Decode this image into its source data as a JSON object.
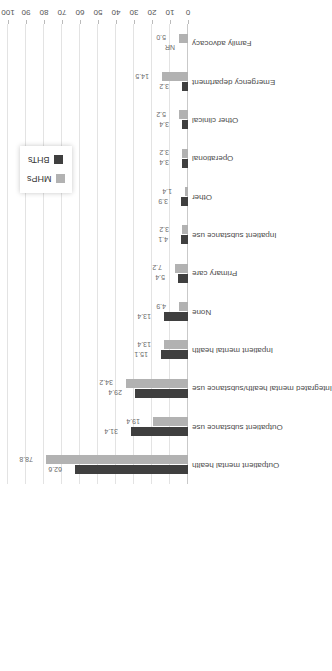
{
  "chart_data": {
    "type": "bar",
    "title": "",
    "subtitle": "",
    "xlabel": "",
    "ylabel": "",
    "ylim": [
      0,
      100
    ],
    "yticks": [
      "0",
      "10",
      "20",
      "30",
      "40",
      "50",
      "60",
      "70",
      "80",
      "90",
      "100"
    ],
    "grid": true,
    "legend_position": "top-center",
    "orientation": "vertical-bars-rotated-90ccw",
    "categories": [
      "Outpatient mental health",
      "Outpatient substance use",
      "Integrated mental health/substance use",
      "Inpatient mental health",
      "None",
      "Primary care",
      "Inpatient substance use",
      "Other",
      "Operational",
      "Other clinical",
      "Emergency department",
      "Family advocacy"
    ],
    "series": [
      {
        "name": "BHTs",
        "color": "#3f3f3f",
        "values": [
          62.6,
          31.4,
          29.4,
          15.1,
          13.4,
          5.4,
          4.1,
          3.9,
          3.4,
          3.4,
          3.2,
          null
        ],
        "labels": [
          "62.6",
          "31.4",
          "29.4",
          "15.1",
          "13.4",
          "5.4",
          "4.1",
          "3.9",
          "3.4",
          "3.4",
          "3.2",
          "NR"
        ]
      },
      {
        "name": "MHPs",
        "color": "#b2b2b2",
        "values": [
          78.8,
          19.4,
          34.2,
          13.4,
          4.9,
          7.2,
          3.2,
          1.4,
          3.2,
          5.2,
          14.5,
          5.0
        ],
        "labels": [
          "78.8",
          "19.4",
          "34.2",
          "13.4",
          "4.9",
          "7.2",
          "3.2",
          "1.4",
          "3.2",
          "5.2",
          "14.5",
          "5.0"
        ]
      }
    ]
  },
  "legend": {
    "items": [
      {
        "label": "BHTs",
        "color": "#3f3f3f"
      },
      {
        "label": "MHPs",
        "color": "#b2b2b2"
      }
    ]
  },
  "colors": {
    "bht": "#3f3f3f",
    "mhp": "#b2b2b2",
    "grid": "#e3e3e3",
    "axis": "#c9c9c9",
    "label_text": "#6a6a6a",
    "background": "#ffffff"
  }
}
